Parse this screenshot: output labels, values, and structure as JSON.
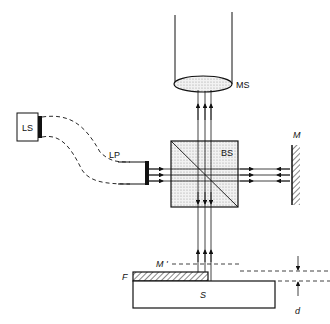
{
  "diagram": {
    "type": "interferometer-schematic",
    "labels": {
      "light_source": "LS",
      "light_pipe": "LP",
      "microscope": "MS",
      "beam_splitter": "BS",
      "mirror": "M",
      "virtual_mirror": "M '",
      "film": "F",
      "substrate": "S",
      "thickness": "d"
    },
    "colors": {
      "line": "#111111",
      "fill_gray": "#d8d8d8",
      "background": "#ffffff"
    }
  }
}
